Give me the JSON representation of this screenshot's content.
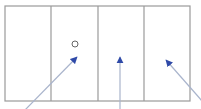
{
  "colors": {
    "frame": "#9a9a9a",
    "arrow_line": "#a9b4cc",
    "arrow_head": "#2f4aa8",
    "circle": "#555555",
    "background": "#ffffff"
  },
  "frame": {
    "x": 5,
    "y": 6,
    "width": 185,
    "height": 95
  },
  "dividers": [
    51,
    98,
    144
  ],
  "circle": {
    "cx": 75,
    "cy": 44,
    "r": 3
  },
  "arrows": [
    {
      "x1": 25,
      "y1": 110,
      "x2": 77,
      "y2": 57
    },
    {
      "x1": 120,
      "y1": 110,
      "x2": 120,
      "y2": 57
    },
    {
      "x1": 203,
      "y1": 102,
      "x2": 166,
      "y2": 60
    }
  ]
}
